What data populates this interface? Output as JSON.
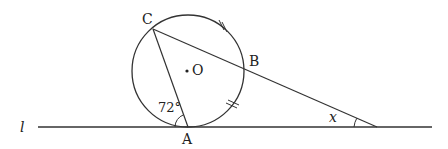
{
  "diagram": {
    "line_label": "l",
    "points": {
      "A": "A",
      "B": "B",
      "C": "C",
      "O": "O"
    },
    "angle_at_A": "72°",
    "angle_x": "x",
    "stroke_color": "#333333",
    "equal_arc_ticks": 2
  }
}
